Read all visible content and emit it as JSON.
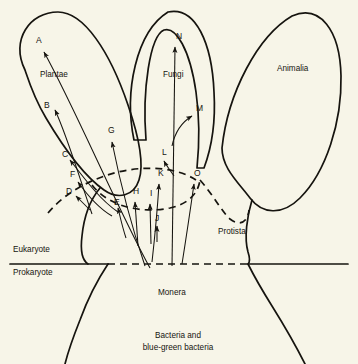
{
  "figure": {
    "background_color": "#f7f5e8",
    "ink_color": "#16140f"
  },
  "kingdoms": [
    {
      "id": "plantae",
      "label": "Plantae",
      "x": 40,
      "y": 77
    },
    {
      "id": "fungi",
      "label": "Fungi",
      "x": 163,
      "y": 77
    },
    {
      "id": "animalia",
      "label": "Animalia",
      "x": 277,
      "y": 71
    },
    {
      "id": "protista",
      "label": "Protista",
      "x": 218,
      "y": 234
    },
    {
      "id": "monera",
      "label": "Monera",
      "x": 158,
      "y": 295
    }
  ],
  "cell_type_labels": [
    {
      "id": "eukaryote",
      "label": "Eukaryote",
      "x": 13,
      "y": 252
    },
    {
      "id": "prokaryote",
      "label": "Prokaryote",
      "x": 13,
      "y": 275
    }
  ],
  "base_caption": {
    "line1": "Bacteria and",
    "line2": "blue-green bacteria",
    "x": 178,
    "y1": 338,
    "y2": 350
  },
  "arrow_labels": [
    {
      "id": "A",
      "label": "A",
      "x": 36,
      "y": 43
    },
    {
      "id": "B",
      "label": "B",
      "x": 44,
      "y": 108
    },
    {
      "id": "C",
      "label": "C",
      "x": 62,
      "y": 157
    },
    {
      "id": "D",
      "label": "D",
      "x": 66,
      "y": 194
    },
    {
      "id": "E",
      "label": "E",
      "x": 114,
      "y": 205
    },
    {
      "id": "F",
      "label": "F",
      "x": 70,
      "y": 177
    },
    {
      "id": "G",
      "label": "G",
      "x": 108,
      "y": 133
    },
    {
      "id": "H",
      "label": "H",
      "x": 133,
      "y": 194
    },
    {
      "id": "I",
      "label": "I",
      "x": 150,
      "y": 196
    },
    {
      "id": "J",
      "label": "J",
      "x": 155,
      "y": 221
    },
    {
      "id": "K",
      "label": "K",
      "x": 158,
      "y": 176
    },
    {
      "id": "L",
      "label": "L",
      "x": 162,
      "y": 155
    },
    {
      "id": "M",
      "label": "M",
      "x": 196,
      "y": 111
    },
    {
      "id": "N",
      "label": "N",
      "x": 176,
      "y": 39
    },
    {
      "id": "O",
      "label": "O",
      "x": 194,
      "y": 176
    }
  ],
  "divider": {
    "name": "eukaryote-prokaryote-boundary",
    "left_solid_from": 10,
    "left_solid_to": 108,
    "dashed_from": 108,
    "dashed_to": 248,
    "right_solid_from": 248,
    "right_solid_to": 348,
    "y": 264
  }
}
